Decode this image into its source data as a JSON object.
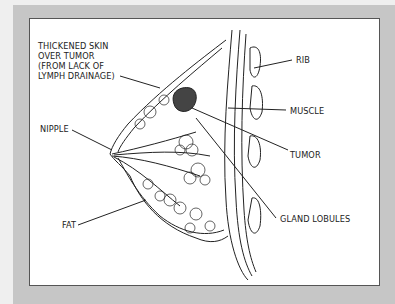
{
  "diagram": {
    "labels": {
      "thickened_skin_line1": "THICKENED SKIN",
      "thickened_skin_line2": "OVER TUMOR",
      "thickened_skin_line3": "(FROM LACK OF",
      "thickened_skin_line4": "LYMPH DRAINAGE)",
      "rib": "RIB",
      "muscle": "MUSCLE",
      "nipple": "NIPPLE",
      "tumor": "TUMOR",
      "fat": "FAT",
      "gland_lobules": "GLAND LOBULES"
    },
    "colors": {
      "background": "#efefef",
      "frame": "#c6c6c6",
      "panel": "#ffffff",
      "ink": "#222222"
    }
  }
}
